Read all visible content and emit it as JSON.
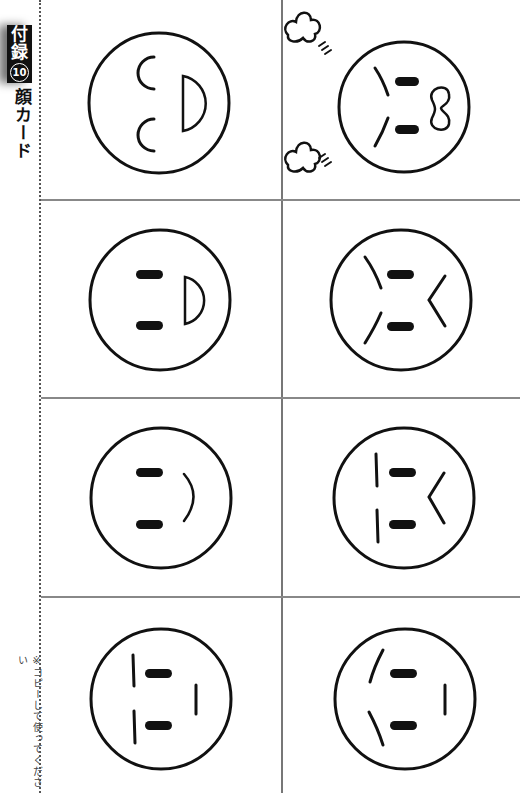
{
  "side_tab": {
    "label_line1": "付",
    "label_line2": "録",
    "number": "10"
  },
  "title": "顔カード",
  "note": "※コピーして使ってください",
  "cards": [
    {
      "id": "laughing",
      "description": "Laughing face: curved closed eyes, open D-shaped mouth"
    },
    {
      "id": "angry-fuming",
      "description": "Angry face: slanted brows, bar eyes, bone-shaped mouth, steam puffs"
    },
    {
      "id": "smiling-open",
      "description": "Smiling face: bar eyes, small open D-shaped mouth"
    },
    {
      "id": "angry",
      "description": "Angry face: slanted brows, bar eyes, angled frown mouth"
    },
    {
      "id": "happy",
      "description": "Happy face: bar eyes, curved smile"
    },
    {
      "id": "upset",
      "description": "Upset face: straight brows, bar eyes, angled frown mouth"
    },
    {
      "id": "neutral",
      "description": "Neutral face: straight brows, bar eyes, straight mouth"
    },
    {
      "id": "sad",
      "description": "Sad face: tilted brows, bar eyes, straight mouth"
    }
  ],
  "colors": {
    "ink": "#111111",
    "grid": "#888888",
    "tab_bg": "#111111",
    "tab_text": "#ffffff"
  }
}
